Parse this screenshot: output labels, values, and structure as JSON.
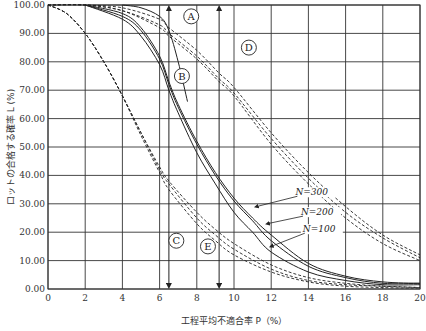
{
  "chart_data": {
    "type": "line",
    "title": "",
    "xlabel": "工程平均不適合率 P（%）",
    "ylabel": "ロットの合格する確率 L (%)",
    "xlim": [
      0,
      20
    ],
    "ylim": [
      0,
      100
    ],
    "grid": true,
    "x_ticks": [
      "0",
      "2",
      "4",
      "6",
      "8",
      "10",
      "12",
      "14",
      "16",
      "18",
      "20"
    ],
    "y_ticks": [
      "0.00",
      "10.00",
      "20.00",
      "30.00",
      "40.00",
      "50.00",
      "60.00",
      "70.00",
      "80.00",
      "90.00",
      "100.00"
    ],
    "region_labels": [
      {
        "text": "A",
        "x": 7.7,
        "y": 96
      },
      {
        "text": "D",
        "x": 10.8,
        "y": 85
      },
      {
        "text": "B",
        "x": 7.2,
        "y": 75
      },
      {
        "text": "C",
        "x": 6.9,
        "y": 17
      },
      {
        "text": "E",
        "x": 8.6,
        "y": 15
      }
    ],
    "annotations": [
      {
        "text": "N=300",
        "x": 13.3,
        "y": 33
      },
      {
        "text": "N=200",
        "x": 13.6,
        "y": 26
      },
      {
        "text": "N=100",
        "x": 13.7,
        "y": 20
      }
    ],
    "vertical_markers": [
      {
        "x": 6.5,
        "label": "left arrow line"
      },
      {
        "x": 9.2,
        "label": "right arrow line"
      }
    ],
    "series": [
      {
        "name": "C-group dashed 1",
        "style": "dashed",
        "x": [
          0,
          1,
          2,
          3,
          4,
          5,
          6,
          6.5,
          8,
          9,
          10,
          12,
          14,
          16,
          18,
          20
        ],
        "values": [
          100,
          97,
          90,
          80,
          68,
          55,
          43,
          38,
          27,
          21,
          16,
          8.5,
          4,
          2,
          1,
          0.5
        ]
      },
      {
        "name": "C-group dashed 2",
        "style": "dashed",
        "x": [
          0,
          1,
          2,
          3,
          4,
          5,
          6,
          6.5,
          8,
          9,
          10,
          12,
          14,
          16,
          18,
          20
        ],
        "values": [
          100,
          97,
          90,
          80,
          68,
          55,
          42,
          37,
          25,
          19,
          14,
          7,
          3,
          1.5,
          1,
          0.5
        ]
      },
      {
        "name": "C-group dashed 3",
        "style": "dashed",
        "x": [
          0,
          1,
          2,
          3,
          4,
          5,
          6,
          6.5,
          8,
          9,
          10,
          12,
          14,
          16,
          18,
          20
        ],
        "values": [
          100,
          97,
          90,
          80,
          68,
          54,
          41,
          35,
          23,
          17,
          12,
          6,
          2.5,
          1,
          0.5,
          0.3
        ]
      },
      {
        "name": "N=300",
        "style": "solid",
        "x": [
          2,
          4,
          5,
          6,
          6.5,
          7,
          8,
          9,
          10,
          11,
          12,
          14,
          16,
          18,
          20
        ],
        "values": [
          100,
          97,
          92,
          82,
          73,
          65,
          52,
          41,
          32,
          25,
          19,
          9,
          4.5,
          2.5,
          2
        ]
      },
      {
        "name": "N=200",
        "style": "solid",
        "x": [
          2,
          4,
          5,
          6,
          6.5,
          7,
          8,
          9,
          10,
          11,
          12,
          14,
          16,
          18,
          20
        ],
        "values": [
          100,
          96,
          91,
          81,
          72,
          64,
          51,
          40,
          31,
          24,
          17,
          8,
          4,
          2,
          2
        ]
      },
      {
        "name": "N=100",
        "style": "solid",
        "x": [
          2,
          4,
          5,
          6,
          6.5,
          7,
          8,
          9,
          10,
          11,
          12,
          14,
          16,
          18,
          20
        ],
        "values": [
          100,
          95,
          89,
          79,
          70,
          62,
          48,
          37,
          27,
          20,
          13,
          6,
          3,
          1.5,
          1.5
        ]
      },
      {
        "name": "sharp solid",
        "style": "solid",
        "x": [
          4,
          5,
          6,
          6.5,
          7,
          7.5
        ],
        "values": [
          100,
          99,
          96,
          91,
          80,
          66
        ]
      },
      {
        "name": "D-group dashed 1",
        "style": "dashed",
        "x": [
          0,
          2,
          4,
          6,
          6.5,
          8,
          9.2,
          10,
          12,
          14,
          16,
          18,
          20
        ],
        "values": [
          100,
          100,
          99,
          95,
          92,
          84,
          76,
          71,
          55,
          41,
          29,
          19,
          12
        ]
      },
      {
        "name": "D-group dashed 2",
        "style": "dashed",
        "x": [
          0,
          2,
          4,
          6,
          6.5,
          8,
          9.2,
          10,
          12,
          14,
          16,
          18,
          20
        ],
        "values": [
          100,
          100,
          98,
          93,
          90,
          82,
          74,
          69,
          53,
          39,
          27,
          18,
          11
        ]
      },
      {
        "name": "D-group dashed 3",
        "style": "dashed",
        "x": [
          0,
          2,
          4,
          6,
          6.5,
          8,
          9.2,
          10,
          12,
          14,
          16,
          18,
          20
        ],
        "values": [
          100,
          100,
          98,
          92,
          89,
          81,
          73,
          68,
          51,
          37,
          25,
          16,
          10
        ]
      }
    ]
  }
}
